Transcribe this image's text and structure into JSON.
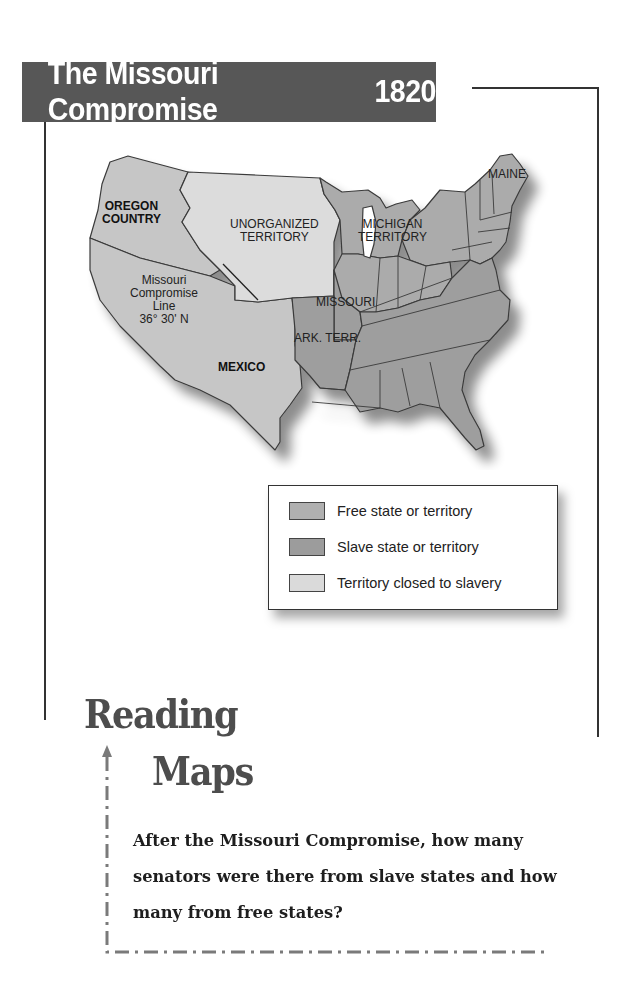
{
  "header": {
    "title": "The Missouri Compromise",
    "year": "1820"
  },
  "map": {
    "labels": {
      "oregon_country": [
        "OREGON",
        "COUNTRY"
      ],
      "unorganized_territory": [
        "UNORGANIZED",
        "TERRITORY"
      ],
      "michigan_territory": [
        "MICHIGAN",
        "TERRITORY"
      ],
      "maine": "MAINE",
      "missouri": "MISSOURI",
      "ark_terr": "ARK. TERR.",
      "mexico": "MEXICO",
      "compromise_line": [
        "Missouri",
        "Compromise",
        "Line",
        "36° 30' N"
      ]
    },
    "colors": {
      "free": "#ababab",
      "slave": "#9e9e9e",
      "closed": "#dcdcdc",
      "other": "#c6c6c6",
      "border": "#3a3a3a"
    }
  },
  "legend": {
    "items": [
      {
        "label": "Free state or territory",
        "color": "#b0b0b0"
      },
      {
        "label": "Slave state or territory",
        "color": "#9c9c9c"
      },
      {
        "label": "Territory closed to slavery",
        "color": "#dadada"
      }
    ]
  },
  "reading_maps": {
    "title_line1": "Reading",
    "title_line2": "Maps",
    "question": "After the Missouri Compromise, how many senators were there from slave states and how many from free states?"
  }
}
